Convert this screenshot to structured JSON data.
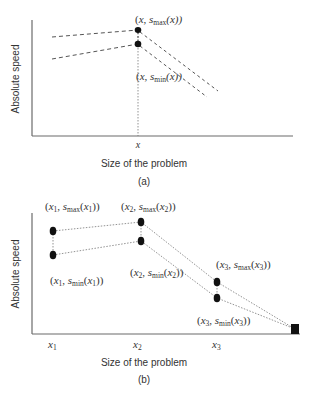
{
  "panel_a": {
    "ylabel": "Absolute speed",
    "xlabel": "Size of the problem",
    "caption": "(a)",
    "tick_x": "x",
    "point_max_label": {
      "open": "(",
      "x": "x",
      "comma": ", s",
      "sub": "max",
      "arg": "(x))"
    },
    "point_min_label": {
      "open": "(",
      "x": "x",
      "comma": ", s",
      "sub": "min",
      "arg": "(x))"
    }
  },
  "panel_b": {
    "ylabel": "Absolute speed",
    "xlabel": "Size of the problem",
    "caption": "(b)",
    "ticks": [
      {
        "base": "x",
        "sub": "1"
      },
      {
        "base": "x",
        "sub": "2"
      },
      {
        "base": "x",
        "sub": "3"
      }
    ],
    "labels": {
      "x1_max": {
        "x": "x",
        "xs": "1",
        "s": "s",
        "ss": "max",
        "ax": "x",
        "axs": "1"
      },
      "x1_min": {
        "x": "x",
        "xs": "1",
        "s": "s",
        "ss": "min",
        "ax": "x",
        "axs": "1"
      },
      "x2_max": {
        "x": "x",
        "xs": "2",
        "s": "s",
        "ss": "max",
        "ax": "x",
        "axs": "2"
      },
      "x2_min": {
        "x": "x",
        "xs": "2",
        "s": "s",
        "ss": "min",
        "ax": "x",
        "axs": "2"
      },
      "x3_max": {
        "x": "x",
        "xs": "3",
        "s": "s",
        "ss": "max",
        "ax": "x",
        "axs": "3"
      },
      "x3_min": {
        "x": "x",
        "xs": "3",
        "s": "s",
        "ss": "min",
        "ax": "x",
        "axs": "3"
      }
    }
  },
  "colors": {
    "axis": "#6b6b6b",
    "line": "#555555",
    "marker": "#111111",
    "text": "#333333",
    "background": "#ffffff"
  }
}
